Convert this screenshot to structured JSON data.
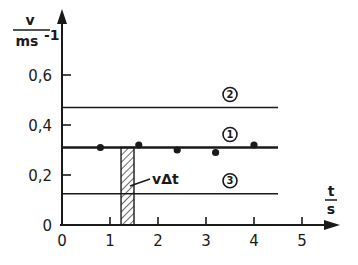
{
  "chart_data": {
    "type": "line",
    "title": "",
    "xlabel": {
      "numerator": "t",
      "denominator": "s"
    },
    "ylabel": {
      "numerator": "v",
      "denominator": "ms",
      "denominator_exponent": "-1"
    },
    "xlim": [
      0,
      5.7
    ],
    "ylim": [
      0,
      0.85
    ],
    "x_ticks": [
      0,
      1,
      2,
      3,
      4,
      5
    ],
    "x_tick_labels": [
      "0",
      "1",
      "2",
      "3",
      "4",
      "5"
    ],
    "y_ticks": [
      0,
      0.2,
      0.4,
      0.6
    ],
    "y_tick_labels": [
      "0",
      "0,2",
      "0,4",
      "0,6"
    ],
    "grid": false,
    "series": [
      {
        "name": "2",
        "label": "②",
        "kind": "constant-line",
        "v": 0.47,
        "t_range": [
          0,
          4.5
        ],
        "label_at_t": 3.5
      },
      {
        "name": "1",
        "label": "①",
        "kind": "constant-line",
        "v": 0.31,
        "t_range": [
          0,
          4.5
        ],
        "label_at_t": 3.5,
        "bold": true
      },
      {
        "name": "3",
        "label": "③",
        "kind": "constant-line",
        "v": 0.125,
        "t_range": [
          0,
          4.5
        ],
        "label_at_t": 3.5
      }
    ],
    "measured_points": {
      "name": "measurements",
      "t": [
        0.8,
        1.6,
        2.4,
        3.2,
        4.0
      ],
      "v": [
        0.31,
        0.32,
        0.3,
        0.29,
        0.32
      ]
    },
    "annotations": [
      {
        "text": "vΔt",
        "kind": "hatched-area",
        "t_range": [
          1.23,
          1.5
        ],
        "v_range": [
          0,
          0.31
        ]
      }
    ]
  }
}
